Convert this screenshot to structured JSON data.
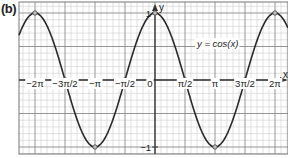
{
  "panel": {
    "label": "(b)"
  },
  "chart_data": {
    "type": "line",
    "title": "",
    "function_label": "y = cos(x)",
    "xlabel": "x",
    "ylabel": "y",
    "xlim": [
      -6.9115,
      7.3304
    ],
    "ylim": [
      -1.1,
      1.2
    ],
    "grid": true,
    "legend": null,
    "x_tick_labels": [
      "−2π",
      "−3π/2",
      "−π",
      "−π/2",
      "0",
      "π/2",
      "π",
      "3π/2",
      "2π"
    ],
    "x_ticks": [
      -6.2832,
      -4.7124,
      -3.1416,
      -1.5708,
      0,
      1.5708,
      3.1416,
      4.7124,
      6.2832
    ],
    "y_tick_labels": [
      "1",
      "−1"
    ],
    "y_ticks": [
      1,
      -1
    ],
    "series": [
      {
        "name": "y = cos(x)",
        "x": [
          -6.2832,
          -4.7124,
          -3.1416,
          -1.5708,
          0,
          1.5708,
          3.1416,
          4.7124,
          6.2832
        ],
        "values": [
          1,
          0,
          -1,
          0,
          1,
          0,
          -1,
          0,
          1
        ]
      }
    ],
    "marked_points": [
      {
        "x": "−2π",
        "y": 1
      },
      {
        "x": "−3π/2",
        "y": 0
      },
      {
        "x": "−π",
        "y": -1
      },
      {
        "x": "−π/2",
        "y": 0
      },
      {
        "x": "0",
        "y": 1
      },
      {
        "x": "π/2",
        "y": 0
      },
      {
        "x": "π",
        "y": -1
      },
      {
        "x": "3π/2",
        "y": 0
      },
      {
        "x": "2π",
        "y": 1
      }
    ]
  },
  "colors": {
    "curve": "#2a2a2a",
    "axis": "#333333",
    "major_grid": "#8a8a8a",
    "minor_grid": "#cfcfcf",
    "point_fill": "#bdbdbd"
  }
}
